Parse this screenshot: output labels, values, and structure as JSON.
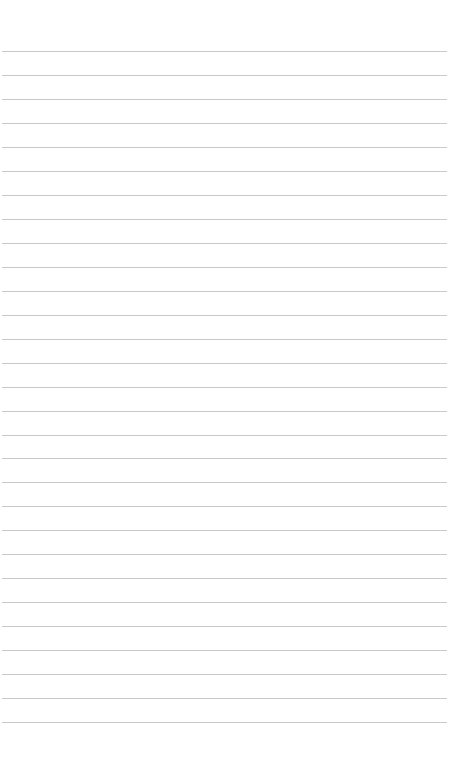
{
  "page": {
    "type": "lined-paper",
    "background_color": "#ffffff",
    "rule_color": "#c9c9c9",
    "rule_count": 29,
    "first_rule_y": 51,
    "rule_spacing": 23.97,
    "rule_left": 2,
    "rule_width": 445
  }
}
